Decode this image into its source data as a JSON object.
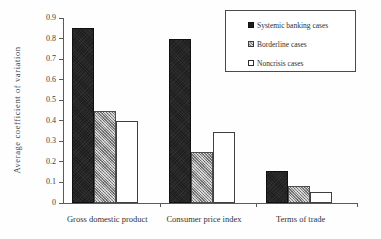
{
  "chart_data": {
    "type": "bar",
    "title": "",
    "xlabel": "",
    "ylabel": "Average  coefficient  of  variation",
    "ylim": [
      0,
      0.9
    ],
    "yticks": [
      "0",
      "0.1",
      "0.2",
      "0.3",
      "0.4",
      "0.5",
      "0.6",
      "0.7",
      "0.8",
      "0.9"
    ],
    "grid": false,
    "legend_position": "top-right",
    "categories": [
      "Gross domestic product",
      "Consumer price index",
      "Terms of trade"
    ],
    "series": [
      {
        "name": "Systemic banking cases",
        "values": [
          0.85,
          0.8,
          0.155
        ],
        "color": "#1d1d1d",
        "swatch": "filled-dark"
      },
      {
        "name": "Borderline cases",
        "values": [
          0.45,
          0.25,
          0.085
        ],
        "color": "#9d9d9d",
        "swatch": "hatched-gray"
      },
      {
        "name": "Noncrisis cases",
        "values": [
          0.4,
          0.345,
          0.055
        ],
        "color": "#ffffff",
        "swatch": "outlined-white"
      }
    ]
  },
  "legend": {
    "items": [
      {
        "label": "Systemic banking cases"
      },
      {
        "label": "Borderline cases"
      },
      {
        "label": "Noncrisis cases"
      }
    ]
  },
  "axes": {
    "y_title": "Average  coefficient  of  variation"
  }
}
